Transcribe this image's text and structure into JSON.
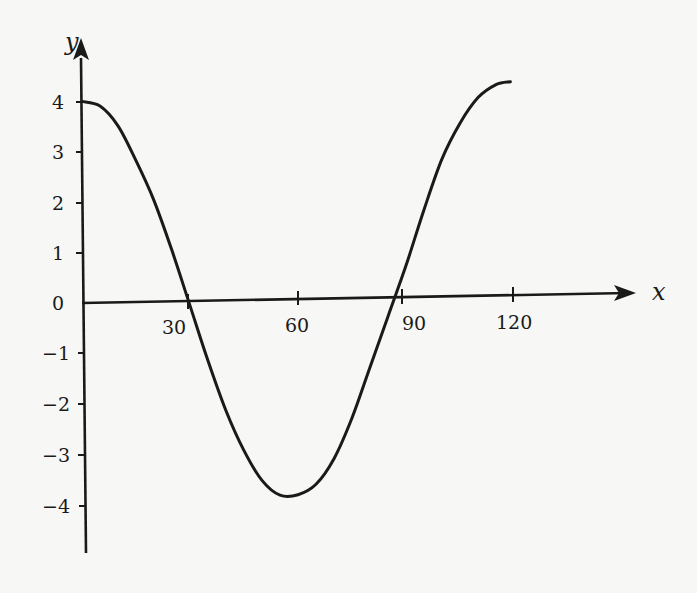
{
  "chart_data": {
    "type": "line",
    "title": "",
    "xlabel": "x",
    "ylabel": "y",
    "xlim": [
      0,
      120
    ],
    "ylim": [
      -4,
      4
    ],
    "grid": false,
    "legend": null,
    "x_ticks": [
      30,
      60,
      90,
      120
    ],
    "y_ticks": [
      4,
      3,
      2,
      1,
      0,
      -1,
      -2,
      -3,
      -4
    ],
    "series": [
      {
        "name": "curve",
        "x": [
          0,
          5,
          10,
          15,
          20,
          25,
          30,
          35,
          40,
          45,
          50,
          55,
          60,
          65,
          70,
          75,
          80,
          85,
          90,
          95,
          100,
          105,
          110,
          115,
          119
        ],
        "y": [
          4.0,
          3.9,
          3.5,
          2.8,
          2.0,
          1.0,
          -0.1,
          -1.2,
          -2.2,
          -3.0,
          -3.6,
          -3.9,
          -3.9,
          -3.7,
          -3.2,
          -2.4,
          -1.4,
          -0.4,
          0.6,
          1.7,
          2.7,
          3.4,
          3.9,
          4.15,
          4.2
        ]
      }
    ],
    "annotations": []
  },
  "axes": {
    "x_label": "x",
    "y_label": "y",
    "x_tick_labels": [
      "30",
      "60",
      "90",
      "120"
    ],
    "y_tick_labels": [
      "4",
      "3",
      "2",
      "1",
      "0",
      "−1",
      "−2",
      "−3",
      "−4"
    ]
  },
  "colors": {
    "ink": "#1a1a1a",
    "paper": "#f7f7f5"
  }
}
